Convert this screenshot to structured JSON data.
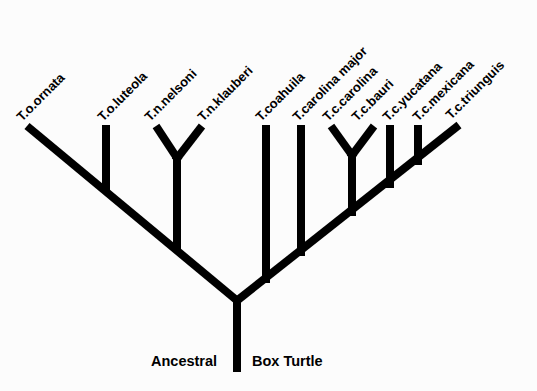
{
  "diagram": {
    "type": "phylogenetic-tree",
    "root_label_left": "Ancestral",
    "root_label_right": "Box Turtle",
    "taxa": [
      {
        "label": "T.o.ornata",
        "tip": [
          28,
          126
        ]
      },
      {
        "label": "T.o.luteola",
        "tip": [
          106,
          126
        ]
      },
      {
        "label": "T.n.nelsoni",
        "tip": [
          156,
          126
        ]
      },
      {
        "label": "T.n.klauberi",
        "tip": [
          202,
          126
        ]
      },
      {
        "label": "T.coahuila",
        "tip": [
          266,
          126
        ]
      },
      {
        "label": "T.carolina major",
        "tip": [
          301,
          126
        ]
      },
      {
        "label": "T.c.carolina",
        "tip": [
          331,
          126
        ]
      },
      {
        "label": "T.c.bauri",
        "tip": [
          374,
          126
        ]
      },
      {
        "label": "T.c.yucatana",
        "tip": [
          390,
          126
        ]
      },
      {
        "label": "T.c.mexicana",
        "tip": [
          418,
          126
        ]
      },
      {
        "label": "T.c.triunguis",
        "tip": [
          457,
          126
        ]
      }
    ],
    "clades": {
      "ornata_group": [
        "T.o.ornata",
        "T.o.luteola",
        "T.n.nelsoni",
        "T.n.klauberi"
      ],
      "carolina_group": [
        "T.coahuila",
        "T.carolina major",
        "T.c.carolina",
        "T.c.bauri",
        "T.c.yucatana",
        "T.c.mexicana",
        "T.c.triunguis"
      ]
    },
    "colors": {
      "branch": "#000000",
      "background": "#fcfcfc"
    }
  }
}
